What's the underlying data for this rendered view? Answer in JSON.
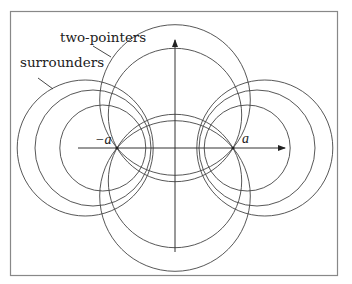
{
  "diagram": {
    "frame": {
      "x": 10,
      "y": 11,
      "width": 328,
      "height": 265,
      "stroke": "#888888"
    },
    "labels": {
      "two_pointers": "two-pointers",
      "surrounders": "surrounders",
      "neg_a": "−a",
      "pos_a": "a"
    },
    "foci": [
      {
        "name": "-a",
        "x": 117,
        "y": 148
      },
      {
        "name": "a",
        "x": 233,
        "y": 148
      }
    ],
    "axes": {
      "x_axis": {
        "x1": 78,
        "x2": 285,
        "y": 148
      },
      "y_axis": {
        "x": 175,
        "y1": 252,
        "y2": 40
      }
    },
    "two_pointer_circles": [
      {
        "cx": 175,
        "cy": 100,
        "r": 75.3
      },
      {
        "cx": 175,
        "cy": 115,
        "r": 66.7
      },
      {
        "cx": 175,
        "cy": 196,
        "r": 75.3
      },
      {
        "cx": 175,
        "cy": 181,
        "r": 66.7
      }
    ],
    "surrounder_circles": [
      {
        "cx": 85.2,
        "cy": 148,
        "r": 68
      },
      {
        "cx": 93,
        "cy": 148,
        "r": 58
      },
      {
        "cx": 102.8,
        "cy": 148,
        "r": 43
      },
      {
        "cx": 264.8,
        "cy": 148,
        "r": 68
      },
      {
        "cx": 257,
        "cy": 148,
        "r": 58
      },
      {
        "cx": 247.2,
        "cy": 148,
        "r": 43
      }
    ]
  }
}
